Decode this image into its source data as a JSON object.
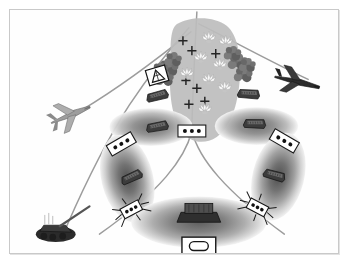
{
  "figure": {
    "kind": "tactical-operations-diagram",
    "palette": {
      "background": "#ffffff",
      "frame_border": "#c9c9c9",
      "route_line": "#9a9a9a",
      "axis_line": "#8e8e8e",
      "objective_fill": "#b9b9b9",
      "threat_ring_outer": "#d8d8d8",
      "threat_ring_mid": "#9e9e9e",
      "threat_ring_inner": "#6e6e6e",
      "threat_ring_core": "#4a4a4a",
      "terrain_mass": "#7c7c7c",
      "symbol_outline": "#1c1c1c",
      "symbol_fill": "#ffffff",
      "vehicle_dark": "#3a3a3a",
      "vehicle_mid": "#5e5e5e",
      "aircraft_light": "#a6a6a6",
      "aircraft_dark": "#2e2e2e",
      "burst_fill": "#f2f2f2",
      "burst_stroke": "#9a9a9a"
    },
    "objective_area": {
      "name": "objective-area",
      "impact_marks": 6,
      "burst_marks": 8
    },
    "terrain_masses": [
      {
        "name": "terrain-mass-left"
      },
      {
        "name": "terrain-mass-right"
      }
    ],
    "threat_envelopes": [
      {
        "name": "threat-envelope-upper-left",
        "rings": 3
      },
      {
        "name": "threat-envelope-upper-right",
        "rings": 3
      },
      {
        "name": "threat-envelope-mid-left",
        "rings": 4
      },
      {
        "name": "threat-envelope-mid-right",
        "rings": 4
      },
      {
        "name": "threat-envelope-lower-center",
        "rings": 4
      }
    ],
    "aircraft": [
      {
        "name": "aircraft-fighter-left",
        "shade": "light"
      },
      {
        "name": "aircraft-strike-right",
        "shade": "dark"
      }
    ],
    "ground_units": [
      {
        "name": "ground-unit-artillery-bottom-left"
      },
      {
        "name": "ground-unit-launcher-upper-left"
      },
      {
        "name": "ground-unit-launcher-upper-right"
      },
      {
        "name": "ground-unit-launcher-mid-upper-left"
      },
      {
        "name": "ground-unit-launcher-mid-upper-right"
      },
      {
        "name": "ground-unit-launcher-mid-left"
      },
      {
        "name": "ground-unit-launcher-mid-right"
      },
      {
        "name": "ground-unit-vessel-bottom-center"
      }
    ],
    "unit_markers": [
      {
        "name": "unit-marker-center",
        "dots": 3,
        "tilt_deg": 0
      },
      {
        "name": "unit-marker-left",
        "dots": 3,
        "tilt_deg": -28
      },
      {
        "name": "unit-marker-right",
        "dots": 3,
        "tilt_deg": 28
      }
    ],
    "radar_sites": [
      {
        "name": "radar-site-left",
        "dots": 3,
        "spikes": 8
      },
      {
        "name": "radar-site-right",
        "dots": 3,
        "spikes": 8
      }
    ],
    "hazard_marker": {
      "name": "hazard-triangle-marker",
      "glyph": "triangle"
    },
    "objective_label": {
      "name": "objective-label-box",
      "glyph": "rounded-rect"
    },
    "routes": [
      {
        "name": "route-ingress-north-west"
      },
      {
        "name": "route-ingress-north-east"
      },
      {
        "name": "route-egress-south-west"
      },
      {
        "name": "route-egress-south-east"
      },
      {
        "name": "route-ground-axis-west"
      },
      {
        "name": "route-center-axis"
      }
    ]
  }
}
